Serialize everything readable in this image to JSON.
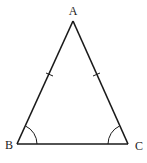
{
  "diagram": {
    "colors": {
      "stroke": "#1a1a1a",
      "label": "#222222",
      "background": "#ffffff"
    },
    "vertices": {
      "A": {
        "label": "A",
        "x": 73,
        "y": 21
      },
      "B": {
        "label": "B",
        "x": 17,
        "y": 144
      },
      "C": {
        "label": "C",
        "x": 128,
        "y": 144
      }
    },
    "labels": {
      "A": "A",
      "B": "B",
      "C": "C"
    },
    "marks": {
      "equal_sides": [
        "AB",
        "AC"
      ],
      "equal_angles": [
        "B",
        "C"
      ]
    }
  }
}
